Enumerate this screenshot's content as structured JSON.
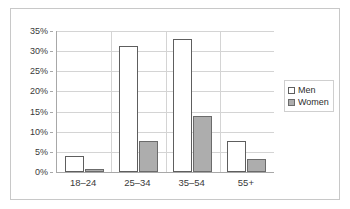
{
  "chart_data": {
    "type": "bar",
    "title": "",
    "subtitle": "",
    "xlabel": "",
    "ylabel": "",
    "categories": [
      "18–24",
      "25–34",
      "35–54",
      "55+"
    ],
    "series": [
      {
        "name": "Men",
        "values": [
          4.0,
          31.2,
          33.0,
          7.7
        ],
        "color": "#ffffff",
        "border_color": "#5e5e5e"
      },
      {
        "name": "Women",
        "values": [
          0.7,
          7.8,
          13.8,
          3.3
        ],
        "color": "#adadad",
        "border_color": "#6b6b6b"
      }
    ],
    "ylim": [
      0,
      35
    ],
    "ytick_values": [
      0,
      5,
      10,
      15,
      20,
      25,
      30,
      35
    ],
    "ytick_labels": [
      "0%",
      "5%",
      "10%",
      "15%",
      "20%",
      "25%",
      "30%",
      "35%"
    ],
    "grid": {
      "horizontal": true,
      "vertical": true,
      "color": "#d4d4d4"
    },
    "legend": {
      "position": "right",
      "entries": [
        {
          "label": "Men",
          "swatch": "men-swatch"
        },
        {
          "label": "Women",
          "swatch": "women-swatch"
        }
      ]
    },
    "frame": {
      "border_color": "#c8c8c8",
      "background": "#ffffff"
    },
    "axis_color": "#a8a8a8"
  }
}
